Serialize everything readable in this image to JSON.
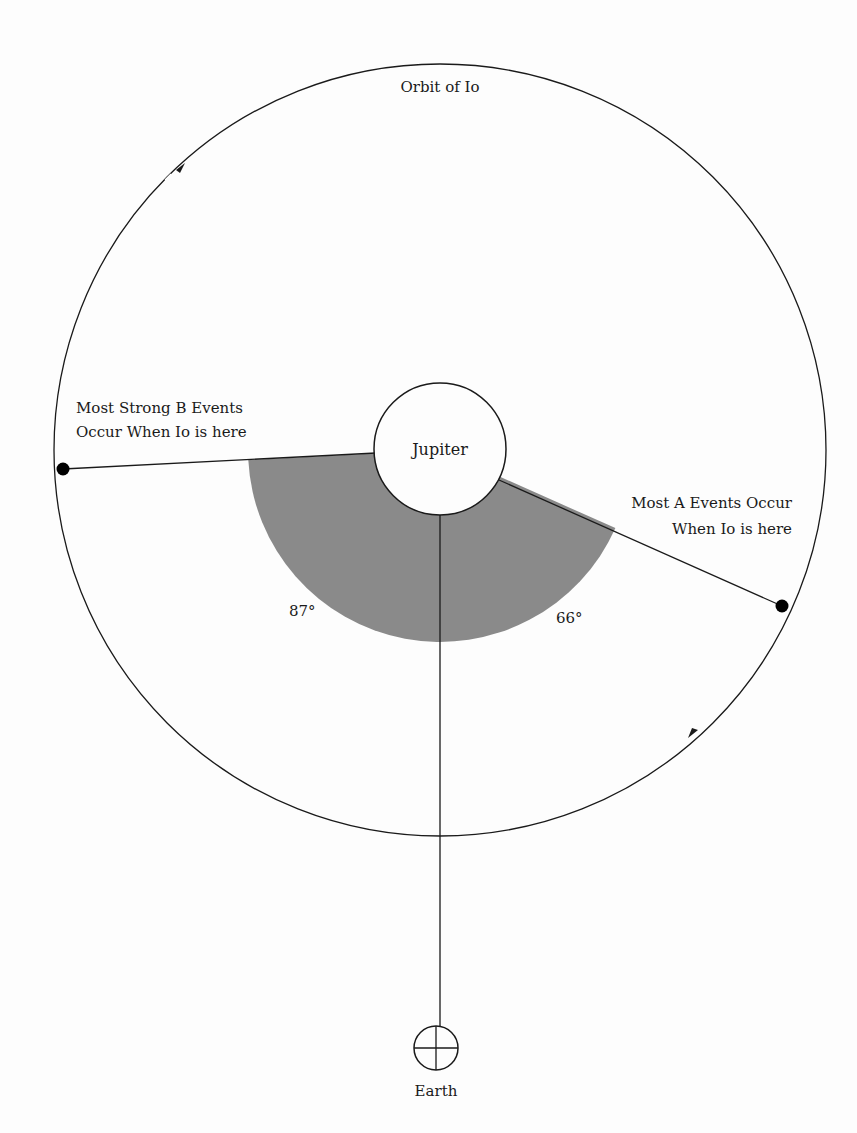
{
  "diagram": {
    "orbit_label": "Orbit of Io",
    "planet_label": "Jupiter",
    "observer_label": "Earth",
    "b_events_label_line1": "Most Strong B Events",
    "b_events_label_line2": "Occur When Io is here",
    "a_events_label_line1": "Most A Events Occur",
    "a_events_label_line2": "When Io is here",
    "angle_b": "87°",
    "angle_a": "66°",
    "colors": {
      "line": "#1a1a1a",
      "wedge": "#8a8a8a",
      "background": "#fdfdfd"
    },
    "orbit_direction": "counterclockwise"
  }
}
